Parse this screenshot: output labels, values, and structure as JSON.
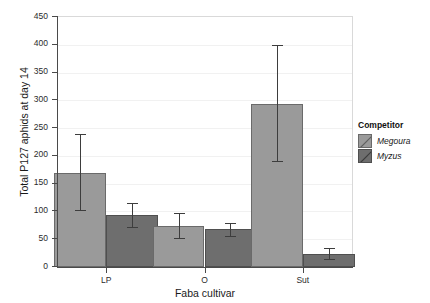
{
  "chart_data": {
    "type": "bar",
    "title": "",
    "xlabel": "Faba cultivar",
    "ylabel": "Total P127 aphids at day 14",
    "categories": [
      "LP",
      "O",
      "Sut"
    ],
    "ylim": [
      0,
      450
    ],
    "yticks": [
      0,
      50,
      100,
      150,
      200,
      250,
      300,
      350,
      400,
      450
    ],
    "grid": true,
    "legend_position": "right",
    "legend_title": "Competitor",
    "series": [
      {
        "name": "Megoura",
        "color": "#9a9a9a",
        "values": [
          170,
          74,
          294
        ],
        "error_low": [
          103,
          53,
          191
        ],
        "error_high": [
          240,
          97,
          399
        ]
      },
      {
        "name": "Myzus",
        "color": "#6e6e6e",
        "values": [
          93,
          68,
          24
        ],
        "error_low": [
          72,
          56,
          14
        ],
        "error_high": [
          115,
          80,
          35
        ]
      }
    ]
  },
  "axis": {
    "y_tick_labels": [
      "450",
      "400",
      "350",
      "300",
      "250",
      "200",
      "150",
      "100",
      "50",
      "0"
    ],
    "x_tick_labels": [
      "LP",
      "O",
      "Sut"
    ],
    "y_title": "Total P127 aphids at day 14",
    "x_title": "Faba cultivar"
  },
  "legend": {
    "title": "Competitor",
    "items": [
      {
        "label": "Megoura"
      },
      {
        "label": "Myzus"
      }
    ]
  }
}
